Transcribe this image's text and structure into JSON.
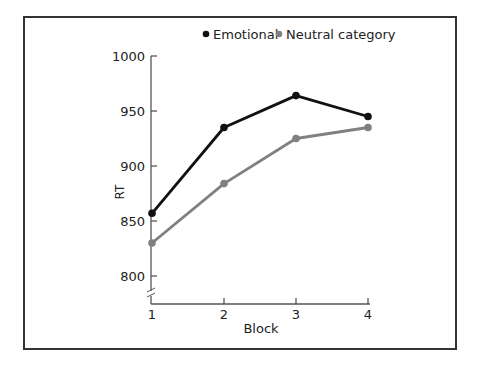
{
  "chart_data": {
    "type": "line",
    "title": "",
    "xlabel": "Block",
    "ylabel": "RT",
    "categories": [
      "1",
      "2",
      "3",
      "4"
    ],
    "x": [
      1,
      2,
      3,
      4
    ],
    "series": [
      {
        "name": "Emotional",
        "color": "#111111",
        "values": [
          857,
          935,
          964,
          945
        ]
      },
      {
        "name": "Neutral category",
        "color": "#808080",
        "values": [
          830,
          884,
          925,
          935
        ]
      }
    ],
    "yticks": [
      800,
      850,
      900,
      950,
      1000
    ],
    "ytick_labels": [
      "800",
      "850",
      "900",
      "950",
      "1000"
    ],
    "ylim": [
      780,
      1000
    ],
    "axis_break": true,
    "grid": false,
    "legend_position": "top"
  },
  "legend": {
    "items": [
      {
        "label": "Emotional",
        "color": "#111111"
      },
      {
        "label": "Neutral category",
        "color": "#808080"
      }
    ]
  }
}
